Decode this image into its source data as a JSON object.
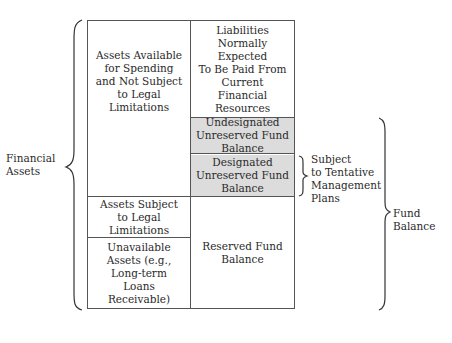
{
  "left_column": {
    "available_assets": "Assets Available\nfor Spending\nand Not Subject\nto Legal\nLimitations",
    "legal_limit_assets": "Assets Subject\nto Legal\nLimitations",
    "unavailable_assets": "Unavailable\nAssets (e.g.,\nLong-term\nLoans\nReceivable)"
  },
  "right_column": {
    "liabilities": "Liabilities\nNormally\nExpected\nTo Be Paid From\nCurrent\nFinancial\nResources",
    "undesignated": "Undesignated\nUnreserved Fund\nBalance",
    "designated": "Designated\nUnreserved Fund\nBalance",
    "reserved": "Reserved Fund\nBalance"
  },
  "braces": {
    "financial_assets": "Financial\nAssets",
    "tentative_plans": "Subject\nto Tentative\nManagement\nPlans",
    "fund_balance": "Fund\nBalance"
  },
  "colors": {
    "shaded": "#dcdcdc",
    "lines": "#555555"
  }
}
